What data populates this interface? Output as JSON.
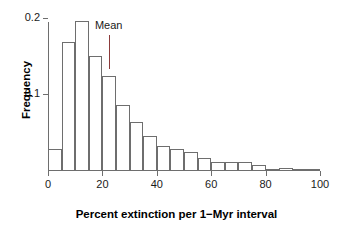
{
  "chart_data": {
    "type": "bar",
    "title": "",
    "xlabel": "Percent extinction per 1−Myr interval",
    "ylabel": "Frequency",
    "xlim": [
      0,
      100
    ],
    "ylim": [
      0,
      0.205
    ],
    "grid": false,
    "legend": false,
    "bin_width": 5,
    "bin_starts": [
      0,
      5,
      10,
      15,
      20,
      25,
      30,
      35,
      40,
      45,
      50,
      55,
      60,
      65,
      70,
      75,
      80,
      85,
      90,
      95
    ],
    "categories": [
      "0–5",
      "5–10",
      "10–15",
      "15–20",
      "20–25",
      "25–30",
      "30–35",
      "35–40",
      "40–45",
      "45–50",
      "50–55",
      "55–60",
      "60–65",
      "65–70",
      "70–75",
      "75–80",
      "80–85",
      "85–90",
      "90–95",
      "95–100"
    ],
    "values": [
      0.028,
      0.168,
      0.196,
      0.15,
      0.123,
      0.085,
      0.063,
      0.045,
      0.032,
      0.027,
      0.024,
      0.016,
      0.011,
      0.011,
      0.01,
      0.007,
      0.0,
      0.003,
      0.0,
      0.0
    ],
    "xticks": [
      0,
      20,
      40,
      60,
      80,
      100
    ],
    "xtick_labels": [
      "0",
      "20",
      "40",
      "60",
      "80",
      "100"
    ],
    "yticks": [
      0.1,
      0.2
    ],
    "ytick_labels": [
      "0.1",
      "0.2"
    ],
    "annotations": [
      {
        "name": "mean",
        "label": "Mean",
        "x": 22.3,
        "line_top_value": 0.178,
        "line_bottom_value": 0.133,
        "color": "#8c3b3b"
      }
    ],
    "colors": {
      "bar_fill": "#ffffff",
      "bar_edge": "#6e6e6e",
      "axis": "#6e6e6e",
      "text": "#000000",
      "mean": "#8c3b3b"
    }
  }
}
